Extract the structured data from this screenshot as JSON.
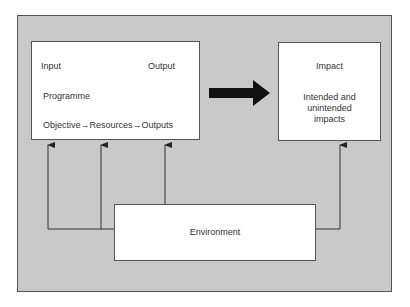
{
  "diagram": {
    "programme_box": {
      "input_label": "Input",
      "output_label": "Output",
      "programme_label": "Programme",
      "chain": {
        "objective": "Objective",
        "resources": "Resources",
        "outputs": "Outputs",
        "arrow_glyph": "→"
      }
    },
    "impact_box": {
      "title": "Impact",
      "line1": "Intended and",
      "line2": "unintended",
      "line3": "impacts"
    },
    "environment_box": {
      "label": "Environment"
    },
    "colors": {
      "panel": "#c9c9c9",
      "box": "#ffffff",
      "line": "#333333",
      "big_arrow": "#111111"
    }
  }
}
